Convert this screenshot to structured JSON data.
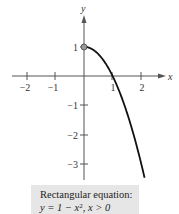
{
  "chart_data": {
    "type": "line",
    "title": "",
    "xlabel": "x",
    "ylabel": "y",
    "xlim": [
      -2.5,
      2.8
    ],
    "ylim": [
      -3.5,
      2.1
    ],
    "grid": false,
    "x_ticks": [
      -2,
      -1,
      1,
      2
    ],
    "x_tick_labels": [
      "−2",
      "−1",
      "1",
      "2"
    ],
    "y_ticks": [
      1,
      -1,
      -2,
      -3
    ],
    "y_tick_labels": [
      "1",
      "−1",
      "−2",
      "−3"
    ],
    "series": [
      {
        "name": "y = 1 − x², x > 0",
        "x": [
          0,
          0.25,
          0.5,
          0.75,
          1.0,
          1.25,
          1.5,
          1.63
        ],
        "y": [
          1,
          0.9375,
          0.75,
          0.4375,
          0,
          -0.5625,
          -1.25,
          -1.657
        ]
      }
    ],
    "annotations": [
      {
        "type": "open-point",
        "x": 0,
        "y": 1
      }
    ],
    "caption": {
      "line1": "Rectangular equation:",
      "line2_prefix": "y = 1 − x",
      "line2_exp": "2",
      "line2_suffix": ",  x > 0"
    }
  }
}
